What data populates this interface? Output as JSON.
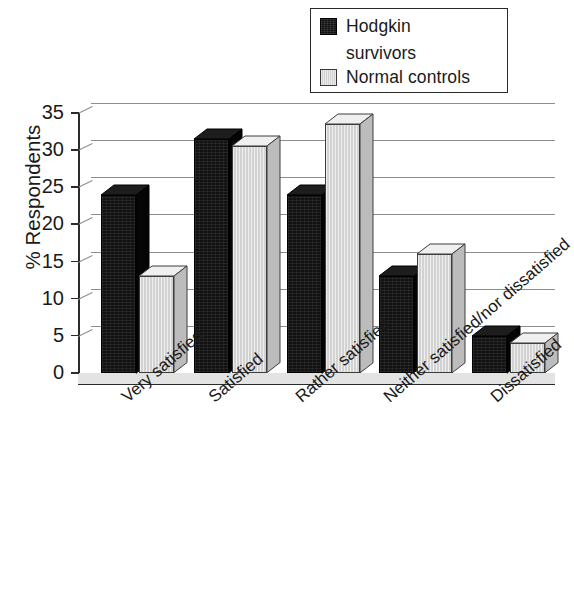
{
  "chart_data": {
    "type": "bar",
    "title": "",
    "xlabel": "",
    "ylabel": "% Respondents",
    "ylim": [
      0,
      35
    ],
    "yticks": [
      "0",
      "5",
      "10",
      "15",
      "20",
      "25",
      "30",
      "35"
    ],
    "grid": true,
    "legend_position": "top-right",
    "categories": [
      "Very satisfied",
      "Satisfied",
      "Rather satisfied",
      "Neither satisfied/nor dissatisfied",
      "Dissatisfied"
    ],
    "series": [
      {
        "name": "Hodgkin survivors",
        "color": "#121212",
        "values": [
          24,
          31.5,
          24,
          13,
          5
        ]
      },
      {
        "name": "Normal controls",
        "color": "#d2d2d2",
        "values": [
          13,
          30.5,
          33.5,
          16,
          4
        ]
      }
    ]
  },
  "legend": {
    "items": [
      {
        "label_line1": "Hodgkin",
        "label_line2": "survivors",
        "swatch": "black-swatch"
      },
      {
        "label_line1": "Normal controls",
        "label_line2": "",
        "swatch": "gray-swatch"
      }
    ]
  }
}
